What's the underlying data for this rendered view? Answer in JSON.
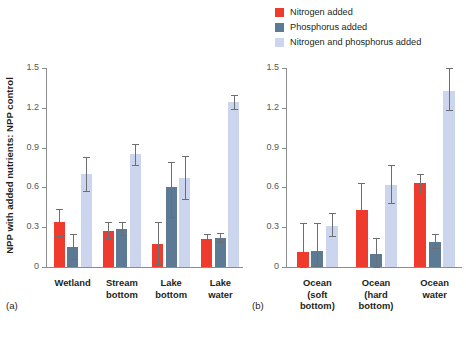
{
  "legend": {
    "position": "top-right",
    "items": [
      {
        "label": "Nitrogen added",
        "color": "#ee3b2e",
        "icon": "legend-swatch-nitrogen"
      },
      {
        "label": "Phosphorus added",
        "color": "#5c7a93",
        "icon": "legend-swatch-phosphorus"
      },
      {
        "label": "Nitrogen and phosphorus added",
        "color": "#cbd5ee",
        "icon": "legend-swatch-nitrogen-phosphorus"
      }
    ]
  },
  "ylabel": "NPP with added nutrients: NPP control",
  "panels": [
    {
      "tag": "(a)"
    },
    {
      "tag": "(b)"
    }
  ],
  "chart_data": [
    {
      "type": "bar",
      "title": "",
      "panel": "(a)",
      "xlabel": "",
      "ylabel": "NPP with added nutrients: NPP control",
      "ylim": [
        0,
        1.5
      ],
      "yticks": [
        0,
        0.3,
        0.6,
        0.9,
        1.2,
        1.5
      ],
      "ytick_labels": [
        "0",
        "0.3",
        "0.6",
        "0.9",
        "1.2",
        "1.5"
      ],
      "grid": false,
      "legend_position": "top-right",
      "categories": [
        "Wetland",
        "Stream bottom",
        "Lake bottom",
        "Lake water"
      ],
      "series": [
        {
          "name": "Nitrogen added",
          "color": "#ee3b2e",
          "values": [
            0.34,
            0.27,
            0.17,
            0.21
          ],
          "err_low": [
            0.23,
            0.22,
            0.02,
            0.18
          ],
          "err_high": [
            0.44,
            0.34,
            0.34,
            0.25
          ]
        },
        {
          "name": "Phosphorus added",
          "color": "#5c7a93",
          "values": [
            0.15,
            0.29,
            0.6,
            0.22
          ],
          "err_low": [
            0.06,
            0.24,
            0.38,
            0.19
          ],
          "err_high": [
            0.25,
            0.34,
            0.79,
            0.26
          ]
        },
        {
          "name": "Nitrogen and phosphorus added",
          "color": "#cbd5ee",
          "values": [
            0.7,
            0.85,
            0.67,
            1.24
          ],
          "err_low": [
            0.57,
            0.77,
            0.51,
            1.19
          ],
          "err_high": [
            0.83,
            0.93,
            0.84,
            1.3
          ]
        }
      ]
    },
    {
      "type": "bar",
      "title": "",
      "panel": "(b)",
      "xlabel": "",
      "ylabel": "",
      "ylim": [
        0,
        1.5
      ],
      "yticks": [
        0,
        0.3,
        0.6,
        0.9,
        1.2,
        1.5
      ],
      "ytick_labels": [
        "0",
        "0.3",
        "0.6",
        "0.9",
        "1.2",
        "1.5"
      ],
      "grid": false,
      "legend_position": "top-right",
      "categories": [
        "Ocean (soft bottom)",
        "Ocean (hard bottom)",
        "Ocean water"
      ],
      "series": [
        {
          "name": "Nitrogen added",
          "color": "#ee3b2e",
          "values": [
            0.11,
            0.43,
            0.63
          ],
          "err_low": [
            0.0,
            0.24,
            0.56
          ],
          "err_high": [
            0.33,
            0.63,
            0.7
          ]
        },
        {
          "name": "Phosphorus added",
          "color": "#5c7a93",
          "values": [
            0.12,
            0.1,
            0.19
          ],
          "err_low": [
            0.01,
            0.0,
            0.14
          ],
          "err_high": [
            0.33,
            0.22,
            0.25
          ]
        },
        {
          "name": "Nitrogen and phosphorus added",
          "color": "#cbd5ee",
          "values": [
            0.31,
            0.62,
            1.33
          ],
          "err_low": [
            0.23,
            0.48,
            1.18
          ],
          "err_high": [
            0.41,
            0.77,
            1.5
          ]
        }
      ]
    }
  ],
  "group_label_lines": {
    "a": [
      [
        "Wetland"
      ],
      [
        "Stream",
        "bottom"
      ],
      [
        "Lake",
        "bottom"
      ],
      [
        "Lake",
        "water"
      ]
    ],
    "b": [
      [
        "Ocean",
        "(soft",
        "bottom)"
      ],
      [
        "Ocean",
        "(hard",
        "bottom)"
      ],
      [
        "Ocean",
        "water"
      ]
    ]
  }
}
